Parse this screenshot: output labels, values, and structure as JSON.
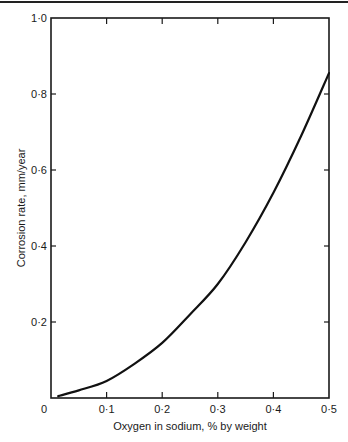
{
  "chart_data": {
    "type": "line",
    "title": "",
    "xlabel": "Oxygen in sodium, % by weight",
    "ylabel": "Corrosion rate, mm/year",
    "xlim": [
      0,
      0.5
    ],
    "ylim": [
      0,
      1.0
    ],
    "x_ticks": [
      "0",
      "0·1",
      "0·2",
      "0·3",
      "0·4",
      "0·5"
    ],
    "y_ticks": [
      "0·2",
      "0·4",
      "0·6",
      "0·8",
      "1·0"
    ],
    "grid": false,
    "legend": null,
    "series": [
      {
        "name": "Corrosion rate",
        "x": [
          0.013,
          0.05,
          0.1,
          0.15,
          0.2,
          0.25,
          0.3,
          0.35,
          0.4,
          0.45,
          0.5
        ],
        "y": [
          0.005,
          0.02,
          0.045,
          0.09,
          0.145,
          0.22,
          0.3,
          0.41,
          0.54,
          0.69,
          0.855
        ]
      }
    ]
  }
}
